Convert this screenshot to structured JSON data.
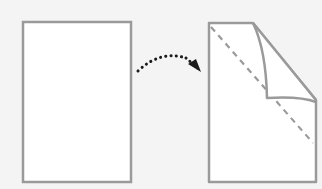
{
  "diagram": {
    "colors": {
      "background": "#f4f4f4",
      "paper_fill": "#ffffff",
      "paper_outline": "#9a9a9a",
      "fold_line": "#9a9a9a",
      "arrow": "#1a1a1a"
    },
    "steps": [
      {
        "id": "before",
        "shape": "blank-sheet"
      },
      {
        "id": "after",
        "shape": "sheet-with-folded-corner",
        "fold_line": "dashed-diagonal"
      }
    ],
    "connector": {
      "style": "dotted-curved-arrow",
      "direction": "left-to-right"
    }
  }
}
